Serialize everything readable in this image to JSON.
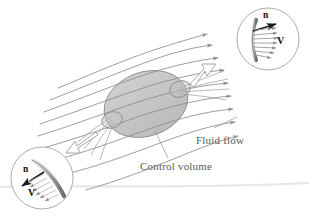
{
  "figure": {
    "name": "control-volume-fluid-flow-diagram",
    "type": "technical-illustration",
    "background_color": "#ffffff"
  },
  "labels": {
    "fluid_flow": "Fluid flow",
    "control_volume": "Control volume"
  },
  "insets": {
    "outflow": {
      "name": "outflow-detail-circle",
      "position": "top-right",
      "normal_symbol": "n",
      "velocity_symbol": "V",
      "description": "outflow surface with normal n and velocity V pointing outward"
    },
    "inflow": {
      "name": "inflow-detail-circle",
      "position": "bottom-left",
      "normal_symbol": "n",
      "velocity_symbol": "V",
      "description": "inflow surface with normal n and velocity V pointing inward"
    }
  },
  "colors": {
    "control_volume_fill": "#c9c9c9",
    "control_volume_stroke": "#8a8a8a",
    "streamline": "#8d8d8d",
    "text": "#5b5b5b",
    "inset_stroke": "#9a9a9a",
    "vector": "#1a1a1a",
    "ground_line": "#e2e2e2"
  },
  "streamlines": {
    "count": 9,
    "direction": "left-to-right, curving upward",
    "arrowheads": true
  }
}
